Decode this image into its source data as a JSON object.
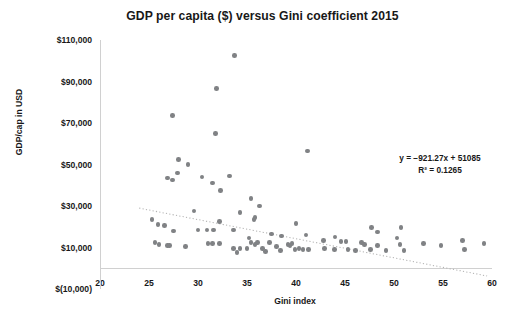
{
  "chart_data": {
    "type": "scatter",
    "title": "GDP per capita ($) versus Gini coefficient 2015",
    "xlabel": "Gini index",
    "ylabel": "GDP/cap in USD",
    "xlim": [
      20,
      60
    ],
    "ylim": [
      -10000,
      110000
    ],
    "xticks": [
      20,
      25,
      30,
      35,
      40,
      45,
      50,
      55,
      60
    ],
    "xtick_labels": [
      "20",
      "25",
      "30",
      "35",
      "40",
      "45",
      "50",
      "55",
      "60"
    ],
    "yticks": [
      -10000,
      10000,
      30000,
      50000,
      70000,
      90000,
      110000
    ],
    "ytick_labels": [
      "$(10,000)",
      "$10,000",
      "$30,000",
      "$50,000",
      "$70,000",
      "$90,000",
      "$110,000"
    ],
    "grid": false,
    "legend": "none",
    "marker_color": "#808285",
    "trendline": {
      "type": "linear-dotted",
      "color": "#b3b3b3",
      "slope": -921.27,
      "intercept": 51085,
      "x_start": 24.0,
      "x_end": 59.5
    },
    "annotations": {
      "equation": "y = −921.27x + 51085",
      "r_squared_label": "R² = 0.1265",
      "r_squared_value": 0.1265
    },
    "points": [
      [
        33.7,
        102500
      ],
      [
        31.9,
        86500
      ],
      [
        27.4,
        73500
      ],
      [
        31.8,
        65000
      ],
      [
        41.2,
        56500
      ],
      [
        28.0,
        52500
      ],
      [
        29.0,
        50000
      ],
      [
        27.9,
        46000
      ],
      [
        26.9,
        43500
      ],
      [
        27.4,
        42500
      ],
      [
        30.4,
        44000
      ],
      [
        33.2,
        44500
      ],
      [
        31.5,
        41000
      ],
      [
        32.3,
        37500
      ],
      [
        35.4,
        33500
      ],
      [
        36.3,
        30000
      ],
      [
        29.6,
        27500
      ],
      [
        34.3,
        27000
      ],
      [
        35.8,
        24500
      ],
      [
        35.7,
        23500
      ],
      [
        25.3,
        23500
      ],
      [
        25.9,
        21000
      ],
      [
        26.6,
        20500
      ],
      [
        32.2,
        22500
      ],
      [
        40.0,
        21500
      ],
      [
        30.0,
        18500
      ],
      [
        30.9,
        18500
      ],
      [
        31.6,
        18500
      ],
      [
        33.6,
        18500
      ],
      [
        27.5,
        18000
      ],
      [
        47.7,
        19500
      ],
      [
        48.3,
        17500
      ],
      [
        50.7,
        19500
      ],
      [
        37.5,
        16500
      ],
      [
        38.5,
        15500
      ],
      [
        35.2,
        14500
      ],
      [
        42.8,
        13500
      ],
      [
        25.6,
        12500
      ],
      [
        26.0,
        11500
      ],
      [
        26.9,
        11000
      ],
      [
        27.1,
        11000
      ],
      [
        28.7,
        10500
      ],
      [
        31.0,
        12000
      ],
      [
        31.5,
        12000
      ],
      [
        32.2,
        12000
      ],
      [
        33.6,
        9500
      ],
      [
        34.3,
        9500
      ],
      [
        35.0,
        9500
      ],
      [
        35.4,
        12500
      ],
      [
        35.8,
        11500
      ],
      [
        36.1,
        12500
      ],
      [
        36.6,
        9500
      ],
      [
        37.3,
        12500
      ],
      [
        38.0,
        10500
      ],
      [
        39.2,
        11500
      ],
      [
        39.4,
        11000
      ],
      [
        39.6,
        12000
      ],
      [
        39.9,
        9000
      ],
      [
        40.3,
        9500
      ],
      [
        40.7,
        9000
      ],
      [
        41.3,
        9000
      ],
      [
        42.9,
        9500
      ],
      [
        43.9,
        9000
      ],
      [
        44.6,
        13000
      ],
      [
        45.1,
        13000
      ],
      [
        45.3,
        9000
      ],
      [
        46.1,
        8500
      ],
      [
        46.7,
        12500
      ],
      [
        47.0,
        11500
      ],
      [
        47.6,
        9000
      ],
      [
        48.3,
        11000
      ],
      [
        49.2,
        8500
      ],
      [
        50.3,
        14500
      ],
      [
        50.6,
        11500
      ],
      [
        51.0,
        8500
      ],
      [
        53.0,
        12000
      ],
      [
        54.8,
        11000
      ],
      [
        57.2,
        9000
      ],
      [
        57.0,
        13500
      ],
      [
        59.2,
        12000
      ],
      [
        41.0,
        16000
      ],
      [
        44.0,
        15000
      ],
      [
        34.0,
        7500
      ],
      [
        36.9,
        8000
      ],
      [
        38.4,
        8500
      ]
    ]
  }
}
